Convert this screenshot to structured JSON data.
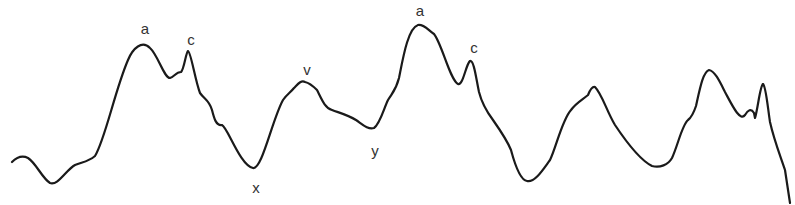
{
  "diagram": {
    "type": "waveform",
    "stroke_color": "#1a1a1a",
    "label_color": "#333333",
    "labels": [
      {
        "text": "a",
        "x": 145,
        "y": 21
      },
      {
        "text": "c",
        "x": 191,
        "y": 32
      },
      {
        "text": "x",
        "x": 256,
        "y": 180
      },
      {
        "text": "v",
        "x": 307,
        "y": 62
      },
      {
        "text": "y",
        "x": 375,
        "y": 143
      },
      {
        "text": "a",
        "x": 420,
        "y": 3
      },
      {
        "text": "c",
        "x": 474,
        "y": 40
      }
    ],
    "trace": "M12,162 C16,158 22,155 28,158 C36,163 42,178 50,183 C58,186 66,170 75,165 C82,162 88,162 95,156 C105,140 115,90 128,60 C133,48 142,40 150,48 C158,55 164,78 170,78 C174,77 176,72 181,72 C184,70 186,52 188,51 C191,52 195,80 200,93 C205,100 209,100 212,110 C214,118 216,126 222,125 C228,128 240,165 253,168 C262,170 272,120 283,100 C287,94 290,93 294,88 C298,84 301,80 305,82 C310,83 313,86 317,90 C322,100 325,108 332,110 C340,113 348,115 356,120 C362,124 368,130 374,128 C380,124 384,108 388,100 C393,92 396,90 399,78 C403,58 408,28 418,25 C424,24 428,30 434,34 C442,44 450,80 458,84 C463,86 466,64 470,61 C474,60 476,78 479,92 C482,104 487,112 493,120 C500,130 507,140 511,150 C515,165 520,180 527,181 C535,183 544,168 550,160 C556,148 562,120 571,110 C576,103 582,100 588,95 C590,90 592,86 595,87 C602,94 607,112 615,125 C625,140 640,160 652,166 C660,168 668,165 672,158 C678,145 682,125 688,120 C692,117 694,112 696,106 C700,88 703,72 709,70 C715,71 720,82 725,92 C732,105 740,122 745,115 C748,110 751,108 754,113 L755,118 C758,108 760,86 763,84 C766,86 768,110 770,122 C774,140 780,155 785,170 L790,203"
  }
}
